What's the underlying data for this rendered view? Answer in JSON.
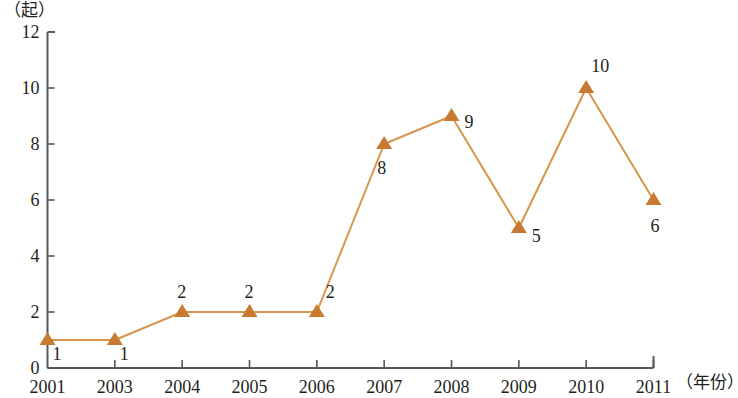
{
  "chart_data": {
    "type": "line",
    "title": "",
    "subtitle": "",
    "xlabel": "（年份）",
    "ylabel": "（起）",
    "categories": [
      "2001",
      "2003",
      "2004",
      "2005",
      "2006",
      "2007",
      "2008",
      "2009",
      "2010",
      "2011"
    ],
    "values": [
      1,
      1,
      2,
      2,
      2,
      8,
      9,
      5,
      10,
      6
    ],
    "point_labels": [
      "1",
      "1",
      "2",
      "2",
      "2",
      "8",
      "9",
      "5",
      "10",
      "6"
    ],
    "ylim": [
      0,
      12
    ],
    "y_ticks": [
      "0",
      "2",
      "4",
      "6",
      "8",
      "10",
      "12"
    ],
    "grid": false,
    "legend": null,
    "marker": "triangle-up",
    "colors": {
      "line": "#d9964b",
      "marker": "#c87a33",
      "axis": "#58585a",
      "text": "#231f20"
    }
  },
  "axes": {
    "y_unit": "（起）",
    "x_unit": "（年份）"
  }
}
